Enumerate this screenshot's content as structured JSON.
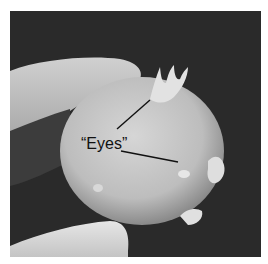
{
  "figure": {
    "annotation": {
      "label": "“Eyes”",
      "pointers": [
        {
          "from": [
            117,
            129
          ],
          "to": [
            150,
            100
          ],
          "target": "top sprout eye"
        },
        {
          "from": [
            121,
            151
          ],
          "to": [
            178,
            162
          ],
          "target": "side eye"
        }
      ]
    },
    "colors": {
      "background": "#2b2b2b",
      "potato": "#c8c8c8",
      "fingers": "#d9d9d9",
      "line": "#111111"
    }
  }
}
